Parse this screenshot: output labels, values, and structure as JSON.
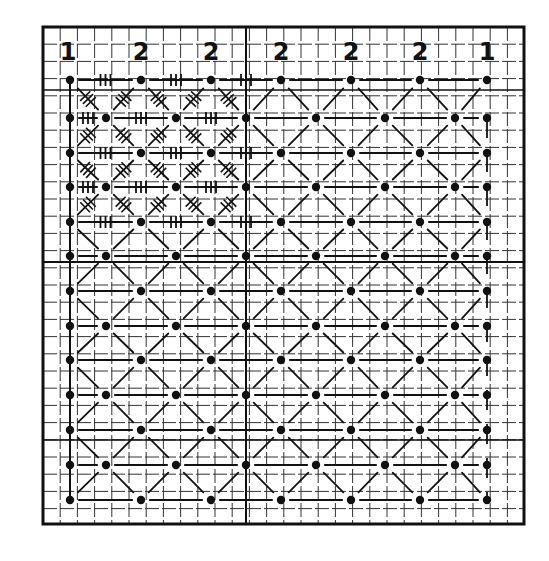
{
  "diagram": {
    "type": "knitting-chart",
    "background": "#ffffff",
    "ink": "#111111",
    "frame": {
      "x": 43,
      "y": 27,
      "width": 481,
      "height": 497
    },
    "grid": {
      "cell": 17.2,
      "cols": 28,
      "rows": 29,
      "major_every": 12
    },
    "column_labels": [
      {
        "text": "1",
        "x": 68
      },
      {
        "text": "2",
        "x": 141
      },
      {
        "text": "2",
        "x": 211
      },
      {
        "text": "2",
        "x": 281
      },
      {
        "text": "2",
        "x": 351
      },
      {
        "text": "2",
        "x": 420
      },
      {
        "text": "1",
        "x": 487
      }
    ],
    "label_y": 60,
    "dot_rows_even": [
      80,
      153,
      222,
      291,
      360,
      430,
      500
    ],
    "dot_cols_even": [
      70,
      141,
      211,
      281,
      351,
      420,
      487
    ],
    "dot_rows_odd": [
      118,
      187,
      256,
      326,
      395,
      465
    ],
    "dot_cols_odd": [
      70,
      106,
      176,
      246,
      316,
      385,
      455,
      487
    ],
    "crossed_region": {
      "cols_max_x": 246,
      "rows_max_y": 222
    },
    "legend": {
      "dot": "stitch point",
      "dashed_diagonal": "diagonal thread",
      "hatched_cross": "worked stitch (cross with tally ticks)",
      "tally_line": "horizontal worked stitch"
    }
  }
}
